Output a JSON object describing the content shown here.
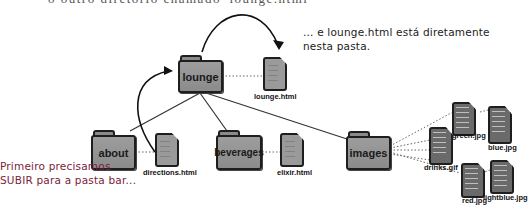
{
  "caption_top": "o outro diretório chamado 'lounge.html'",
  "notes": {
    "right": "... e lounge.html está diretamente nesta pasta.",
    "left": "Primeiro precisamos SUBIR para a pasta bar..."
  },
  "folders": {
    "lounge": "lounge",
    "about": "about",
    "beverages": "beverages",
    "images": "images"
  },
  "files": {
    "lounge_html": "lounge.html",
    "directions_html": "directions.html",
    "elixir_html": "elixir.html",
    "drinks_gif": "drinks.gif",
    "green_jpg": "green.jpg",
    "blue_jpg": "blue.jpg",
    "red_jpg": "red.jpg",
    "lightblue_jpg": "lightblue.jpg"
  },
  "colors": {
    "folder_fill": "#9a9a9a",
    "outline": "#1e1e1e",
    "left_note": "#7a1e3a"
  }
}
